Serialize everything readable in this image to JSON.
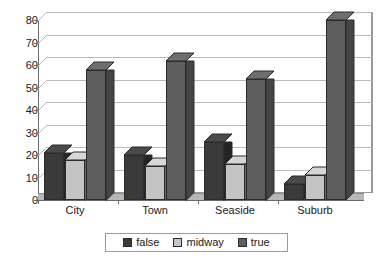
{
  "chart_data": {
    "type": "bar",
    "title": "",
    "xlabel": "",
    "ylabel": "",
    "categories": [
      "City",
      "Town",
      "Seaside",
      "Suburb"
    ],
    "series": [
      {
        "name": "false",
        "color": "#3a3a3a",
        "values": [
          21,
          20,
          26,
          7
        ]
      },
      {
        "name": "midway",
        "color": "#c4c4c4",
        "values": [
          18,
          15,
          16,
          11
        ]
      },
      {
        "name": "true",
        "color": "#5e5e5e",
        "values": [
          58,
          62,
          54,
          80
        ]
      }
    ],
    "ylim": [
      0,
      80
    ],
    "yticks": [
      0,
      10,
      20,
      30,
      40,
      50,
      60,
      70,
      80
    ],
    "ytick_labels": [
      "0",
      "10",
      "20",
      "30",
      "40",
      "50",
      "60",
      "70",
      "80"
    ],
    "grid": true,
    "grid_axis": "y",
    "legend_position": "bottom",
    "style": "3d-column"
  },
  "legend": {
    "items": [
      {
        "label": "false",
        "swatch": "legend-swatch-false"
      },
      {
        "label": "midway",
        "swatch": "legend-swatch-midway"
      },
      {
        "label": "true",
        "swatch": "legend-swatch-true"
      }
    ]
  },
  "colors": {
    "false": "#3a3a3a",
    "false_top": "#4a4a4a",
    "false_side": "#232323",
    "midway": "#c4c4c4",
    "midway_top": "#d6d6d6",
    "midway_side": "#a5a5a5",
    "true": "#5e5e5e",
    "true_top": "#6e6e6e",
    "true_side": "#454545",
    "grid": "#b9b9b9",
    "axis": "#6b6b6b",
    "floor": "#b7b7b7",
    "background": "#ffffff",
    "text": "#1a1a1a"
  }
}
